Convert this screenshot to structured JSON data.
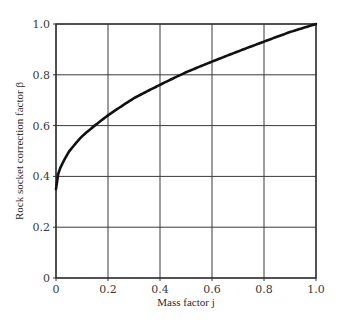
{
  "chart_data": {
    "type": "line",
    "title": "",
    "xlabel": "Mass factor j",
    "ylabel": "Rock socket correction factor β",
    "xlim": [
      0,
      1.0
    ],
    "ylim": [
      0,
      1.0
    ],
    "grid": true,
    "legend": null,
    "x_ticks": [
      "0",
      "0.2",
      "0.4",
      "0.6",
      "0.8",
      "1.0"
    ],
    "y_ticks": [
      "0",
      "0.2",
      "0.4",
      "0.6",
      "0.8",
      "1.0"
    ],
    "series": [
      {
        "name": "β vs j",
        "x": [
          0,
          0.01,
          0.02,
          0.05,
          0.1,
          0.15,
          0.2,
          0.3,
          0.4,
          0.5,
          0.6,
          0.7,
          0.8,
          0.9,
          1.0
        ],
        "y": [
          0.35,
          0.42,
          0.44,
          0.5,
          0.56,
          0.6,
          0.64,
          0.71,
          0.76,
          0.81,
          0.85,
          0.89,
          0.93,
          0.97,
          1.0
        ]
      }
    ]
  }
}
